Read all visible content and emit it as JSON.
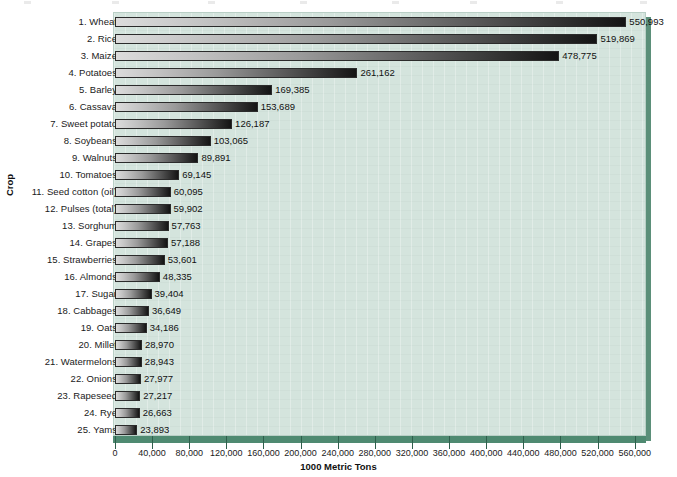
{
  "chart_data": {
    "type": "bar",
    "orientation": "horizontal",
    "title": "",
    "xlabel": "1000 Metric Tons",
    "ylabel": "Crop",
    "xlim": [
      0,
      570000
    ],
    "grid": false,
    "legend": null,
    "xticks": [
      0,
      40000,
      80000,
      120000,
      160000,
      200000,
      240000,
      280000,
      320000,
      360000,
      400000,
      440000,
      480000,
      520000,
      560000
    ],
    "xtick_labels": [
      "0",
      "40,000",
      "80,000",
      "120,000",
      "160,000",
      "200,000",
      "240,000",
      "280,000",
      "320,000",
      "360,000",
      "400,000",
      "440,000",
      "480,000",
      "520,000",
      "560,000"
    ],
    "categories": [
      "1. Wheat",
      "2. Rice",
      "3. Maize",
      "4. Potatoes",
      "5. Barley",
      "6. Cassava",
      "7. Sweet potato",
      "8. Soybeans",
      "9. Walnuts",
      "10. Tomatoes",
      "11. Seed cotton (oil)",
      "12. Pulses (total)",
      "13. Sorghum",
      "14. Grapes",
      "15. Strawberries",
      "16. Almonds",
      "17. Sugar",
      "18. Cabbages",
      "19. Oats",
      "20. Millet",
      "21. Watermelons",
      "22. Onions",
      "23. Rapeseed",
      "24. Rye",
      "25. Yams"
    ],
    "values": [
      550993,
      519869,
      478775,
      261162,
      169385,
      153689,
      126187,
      103065,
      89891,
      69145,
      60095,
      59902,
      57763,
      57188,
      53601,
      48335,
      39404,
      36649,
      34186,
      28970,
      28943,
      27977,
      27217,
      26663,
      23893
    ],
    "value_labels": [
      "550,993",
      "519,869",
      "478,775",
      "261,162",
      "169,385",
      "153,689",
      "126,187",
      "103,065",
      "89,891",
      "69,145",
      "60,095",
      "59,902",
      "57,763",
      "57,188",
      "53,601",
      "48,335",
      "39,404",
      "36,649",
      "34,186",
      "28,970",
      "28,943",
      "27,977",
      "27,217",
      "26,663",
      "23,893"
    ]
  },
  "colors": {
    "plot_background": "#d4e4dd",
    "plot_shadow": "#5b8f79",
    "axis_band": "#4f8a71",
    "bar_light": "#dcdcdc",
    "bar_dark": "#141414",
    "text": "#111111"
  }
}
